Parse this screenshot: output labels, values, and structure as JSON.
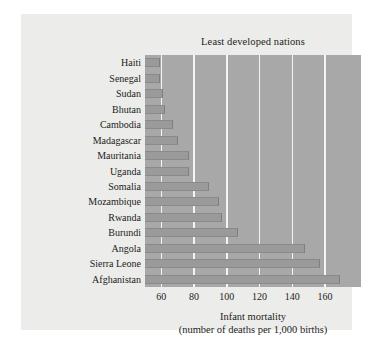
{
  "figure": {
    "title": "Least developed nations",
    "xlabel_line1": "Infant mortality",
    "xlabel_line2": "(number of deaths per 1,000 births)",
    "background_color": "#ececea",
    "plot_color": "#a8a8a8",
    "bar_color": "#9a9a9a",
    "gridline_color": "#f4f4f2"
  },
  "chart_data": {
    "type": "bar",
    "orientation": "horizontal",
    "title": "Least developed nations",
    "xlabel": "Infant mortality (number of deaths per 1,000 births)",
    "ylabel": "",
    "xlim": [
      50,
      182
    ],
    "xticks": [
      60,
      80,
      100,
      120,
      140,
      160
    ],
    "grid": "vertical",
    "legend": null,
    "categories": [
      "Haiti",
      "Senegal",
      "Sudan",
      "Bhutan",
      "Cambodia",
      "Madagascar",
      "Mauritania",
      "Uganda",
      "Somalia",
      "Mozambique",
      "Rwanda",
      "Burundi",
      "Angola",
      "Sierra Leone",
      "Afghanistan"
    ],
    "values": [
      59,
      59,
      61,
      62,
      67,
      70,
      77,
      77,
      89,
      95,
      97,
      107,
      148,
      157,
      169
    ]
  }
}
